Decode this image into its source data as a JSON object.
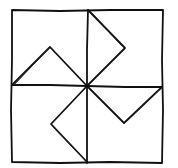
{
  "diagram": {
    "kind": "pinwheel-quilt-block",
    "stroke_color": "#111111",
    "background": "#ffffff",
    "outer_square": {
      "x1": 12,
      "y1": 10,
      "x2": 163,
      "y2": 163
    },
    "center": {
      "x": 87,
      "y": 86
    },
    "blades": [
      {
        "name": "top-left",
        "start": [
          12,
          85
        ],
        "apex": [
          50,
          47
        ],
        "end": [
          87,
          86
        ]
      },
      {
        "name": "top-right",
        "start": [
          88,
          10
        ],
        "apex": [
          125,
          48
        ],
        "end": [
          87,
          86
        ]
      },
      {
        "name": "bottom-right",
        "start": [
          87,
          86
        ],
        "apex": [
          124,
          123
        ],
        "end": [
          162,
          87
        ]
      },
      {
        "name": "bottom-left",
        "start": [
          87,
          86
        ],
        "apex": [
          51,
          124
        ],
        "end": [
          87,
          162
        ]
      }
    ]
  }
}
